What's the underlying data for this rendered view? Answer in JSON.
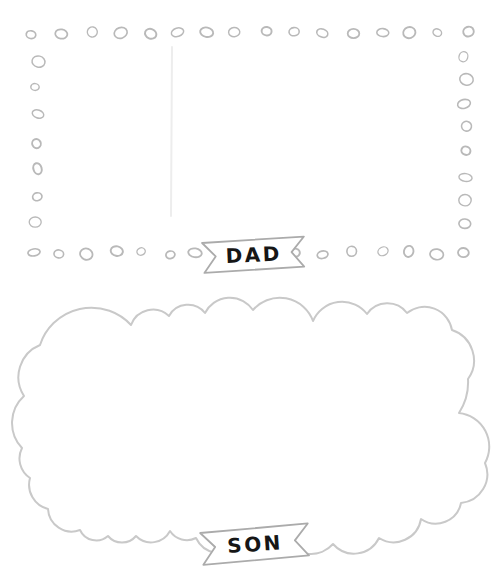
{
  "banners": {
    "dad": {
      "label": "DAD"
    },
    "son": {
      "label": "SON"
    }
  },
  "colors": {
    "background": "#ffffff",
    "dot_outline": "#b9b9b9",
    "cloud_outline": "#c9c9c9",
    "banner_outline": "#ababab",
    "banner_fill": "#ffffff",
    "label_text": "#161616",
    "crease": "#ededed"
  }
}
